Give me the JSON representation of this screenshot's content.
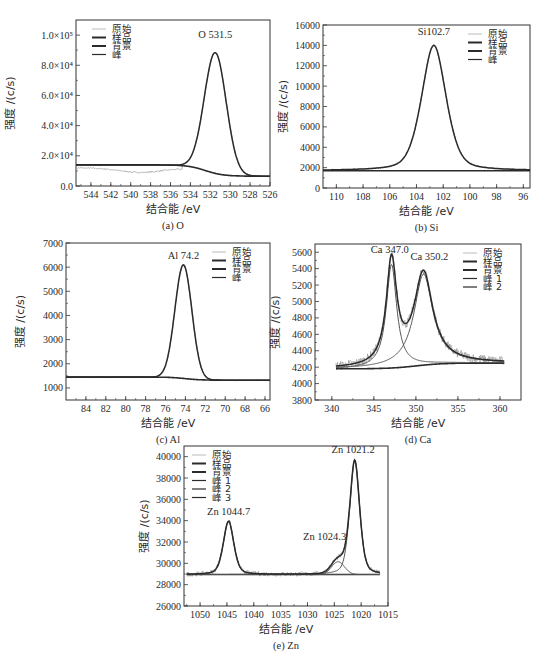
{
  "figure": {
    "chart_data": [
      {
        "id": "a",
        "type": "line",
        "caption": "(a) O",
        "xlabel": "结合能 /eV",
        "ylabel": "强度 /(c/s)",
        "xlim": [
          545.5,
          526
        ],
        "ylim": [
          0,
          110000
        ],
        "xticks": [
          544,
          542,
          540,
          538,
          536,
          534,
          532,
          530,
          528,
          526
        ],
        "yticks": [
          {
            "v": 0,
            "label": "0.0"
          },
          {
            "v": 20000,
            "label": "2.0×10⁴"
          },
          {
            "v": 40000,
            "label": "4.0×10⁴"
          },
          {
            "v": 60000,
            "label": "6.0×10⁴"
          },
          {
            "v": 80000,
            "label": "8.0×10⁴"
          },
          {
            "v": 100000,
            "label": "1.0×10⁵"
          }
        ],
        "frame": {
          "x": 76,
          "y": 20,
          "w": 194,
          "h": 166
        },
        "legend": {
          "pos": "upper-left",
          "items": [
            "原始",
            "样品",
            "背景",
            "峰"
          ]
        },
        "annotations": [
          {
            "text": "O 531.5",
            "x": 531.5,
            "y": 98000
          }
        ],
        "peaks": [
          {
            "center": 531.5,
            "height": 80000,
            "width": 1.1,
            "shape": "gauss"
          }
        ],
        "background": {
          "low": 6500,
          "high": 14000,
          "step_center": 532.5,
          "step_width": 0.9
        },
        "raw_offset_region": {
          "from": 545.5,
          "to": 534.8,
          "dip": 3000,
          "dip_center": 539
        }
      },
      {
        "id": "b",
        "type": "line",
        "caption": "(b) Si",
        "xlabel": "结合能 /eV",
        "ylabel": "强度 /(c/s)",
        "xlim": [
          111,
          95.5
        ],
        "ylim": [
          0,
          16000
        ],
        "xticks": [
          110,
          108,
          106,
          104,
          102,
          100,
          98,
          96
        ],
        "yticks": [
          {
            "v": 0,
            "label": "0"
          },
          {
            "v": 2000,
            "label": "2000"
          },
          {
            "v": 4000,
            "label": "4000"
          },
          {
            "v": 6000,
            "label": "6000"
          },
          {
            "v": 8000,
            "label": "8000"
          },
          {
            "v": 10000,
            "label": "10000"
          },
          {
            "v": 12000,
            "label": "12000"
          },
          {
            "v": 14000,
            "label": "14000"
          },
          {
            "v": 16000,
            "label": "16000"
          }
        ],
        "frame": {
          "x": 323,
          "y": 25,
          "w": 207,
          "h": 163
        },
        "legend": {
          "pos": "upper-right",
          "items": [
            "原始",
            "样品",
            "背景",
            "峰"
          ]
        },
        "annotations": [
          {
            "text": "Si102.7",
            "x": 102.7,
            "y": 15000
          }
        ],
        "peaks": [
          {
            "center": 102.7,
            "height": 12300,
            "width": 0.95,
            "shape": "voigt"
          }
        ],
        "background": {
          "low": 1700,
          "high": 1700,
          "step_center": 102.7,
          "step_width": 1
        }
      },
      {
        "id": "c",
        "type": "line",
        "caption": "(c) Al",
        "xlabel": "结合能 /eV",
        "ylabel": "强度 /(c/s)",
        "xlim": [
          86,
          65.5
        ],
        "ylim": [
          500,
          7000
        ],
        "xticks": [
          84,
          82,
          80,
          78,
          76,
          74,
          72,
          70,
          68,
          66
        ],
        "yticks": [
          {
            "v": 1000,
            "label": "1000"
          },
          {
            "v": 2000,
            "label": "2000"
          },
          {
            "v": 3000,
            "label": "3000"
          },
          {
            "v": 4000,
            "label": "4000"
          },
          {
            "v": 5000,
            "label": "5000"
          },
          {
            "v": 6000,
            "label": "6000"
          },
          {
            "v": 7000,
            "label": "7000"
          }
        ],
        "frame": {
          "x": 66,
          "y": 243,
          "w": 204,
          "h": 157
        },
        "legend": {
          "pos": "upper-right",
          "items": [
            "原始",
            "样品",
            "背景",
            "峰"
          ]
        },
        "annotations": [
          {
            "text": "Al 74.2",
            "x": 74.2,
            "y": 6350
          }
        ],
        "peaks": [
          {
            "center": 74.2,
            "height": 4700,
            "width": 0.85,
            "shape": "gauss"
          }
        ],
        "background": {
          "low": 1320,
          "high": 1450,
          "step_center": 74,
          "step_width": 0.8
        }
      },
      {
        "id": "d",
        "type": "line",
        "caption": "(d) Ca",
        "xlabel": "结合能 /eV",
        "ylabel": "强度 /(c/s)",
        "xlim": [
          338,
          362.5
        ],
        "ylim": [
          3800,
          5700
        ],
        "xticks": [
          340,
          345,
          350,
          355,
          360
        ],
        "yticks": [
          {
            "v": 3800,
            "label": "3800"
          },
          {
            "v": 4000,
            "label": "4000"
          },
          {
            "v": 4200,
            "label": "4200"
          },
          {
            "v": 4400,
            "label": "4400"
          },
          {
            "v": 4600,
            "label": "4600"
          },
          {
            "v": 4800,
            "label": "4800"
          },
          {
            "v": 5000,
            "label": "5000"
          },
          {
            "v": 5200,
            "label": "5200"
          },
          {
            "v": 5400,
            "label": "5400"
          },
          {
            "v": 5600,
            "label": "5600"
          }
        ],
        "frame": {
          "x": 315,
          "y": 244,
          "w": 206,
          "h": 156
        },
        "legend": {
          "pos": "upper-right",
          "items": [
            "原始",
            "样品",
            "背景",
            "峰 1",
            "峰 2"
          ]
        },
        "annotations": [
          {
            "text": "Ca 347.0",
            "x": 346.9,
            "y": 5590
          },
          {
            "text": "Ca 350.2",
            "x": 351.6,
            "y": 5510
          }
        ],
        "peaks": [
          {
            "center": 347.1,
            "height": 1260,
            "width": 0.75,
            "shape": "lorentz"
          },
          {
            "center": 350.9,
            "height": 1110,
            "width": 1.35,
            "shape": "lorentz"
          }
        ],
        "background": {
          "low": 4180,
          "high": 4250,
          "step_center": 350,
          "step_width": 1.6,
          "rising": true
        },
        "x_from": 340.5,
        "x_to": 360.5
      },
      {
        "id": "e",
        "type": "line",
        "caption": "(e) Zn",
        "xlabel": "结合能 /eV",
        "ylabel": "强度 /(c/s)",
        "xlim": [
          1053,
          1015
        ],
        "ylim": [
          26000,
          41000
        ],
        "xticks": [
          1050,
          1045,
          1040,
          1035,
          1030,
          1025,
          1020,
          1015
        ],
        "yticks": [
          {
            "v": 26000,
            "label": "26000"
          },
          {
            "v": 28000,
            "label": "28000"
          },
          {
            "v": 30000,
            "label": "30000"
          },
          {
            "v": 32000,
            "label": "32000"
          },
          {
            "v": 34000,
            "label": "34000"
          },
          {
            "v": 36000,
            "label": "36000"
          },
          {
            "v": 38000,
            "label": "38000"
          },
          {
            "v": 40000,
            "label": "40000"
          }
        ],
        "frame": {
          "x": 184,
          "y": 446,
          "w": 204,
          "h": 160
        },
        "legend": {
          "pos": "upper-left",
          "items": [
            "原始",
            "样品",
            "背景",
            "峰 1",
            "峰 2",
            "峰 3"
          ]
        },
        "annotations": [
          {
            "text": "Zn 1021.2",
            "x": 1021.5,
            "y": 40300
          },
          {
            "text": "Zn 1044.7",
            "x": 1044.7,
            "y": 34500
          },
          {
            "text": "Zn 1024.3",
            "x": 1026.8,
            "y": 32200
          }
        ],
        "peaks": [
          {
            "center": 1021.2,
            "height": 10700,
            "width": 0.95,
            "shape": "voigt"
          },
          {
            "center": 1044.7,
            "height": 5000,
            "width": 1.0,
            "shape": "voigt"
          },
          {
            "center": 1024.3,
            "height": 1200,
            "width": 1.2,
            "shape": "gauss"
          }
        ],
        "background": {
          "low": 28950,
          "high": 28950,
          "step_center": 1030,
          "step_width": 1
        },
        "x_from": 1052.5,
        "x_to": 1016.5
      }
    ]
  }
}
